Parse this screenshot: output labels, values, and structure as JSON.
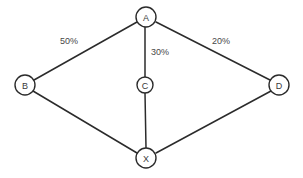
{
  "diagram": {
    "background_color": "#ffffff",
    "line_color": "#2b2b2b",
    "text_color": "#474747",
    "nodes": [
      {
        "id": "A",
        "label": "A",
        "cx": 146,
        "cy": 17,
        "r": 10
      },
      {
        "id": "B",
        "label": "B",
        "cx": 25,
        "cy": 85,
        "r": 10
      },
      {
        "id": "C",
        "label": "C",
        "cx": 145,
        "cy": 85,
        "r": 8
      },
      {
        "id": "D",
        "label": "D",
        "cx": 279,
        "cy": 85,
        "r": 10
      },
      {
        "id": "X",
        "label": "X",
        "cx": 146,
        "cy": 158,
        "r": 10
      }
    ],
    "edges": [
      {
        "id": "a-b",
        "from": "A",
        "to": "B",
        "x1": 137,
        "y1": 22,
        "x2": 34,
        "y2": 80
      },
      {
        "id": "a-c",
        "from": "A",
        "to": "C",
        "x1": 145,
        "y1": 27,
        "x2": 145,
        "y2": 77
      },
      {
        "id": "a-d",
        "from": "A",
        "to": "D",
        "x1": 156,
        "y1": 22,
        "x2": 270,
        "y2": 80
      },
      {
        "id": "b-x",
        "from": "B",
        "to": "X",
        "x1": 33,
        "y1": 91,
        "x2": 137,
        "y2": 153
      },
      {
        "id": "c-x",
        "from": "C",
        "to": "X",
        "x1": 145,
        "y1": 93,
        "x2": 146,
        "y2": 148
      },
      {
        "id": "d-x",
        "from": "D",
        "to": "X",
        "x1": 271,
        "y1": 91,
        "x2": 156,
        "y2": 153
      }
    ],
    "edge_labels": [
      {
        "id": "label-50",
        "edge": "a-b",
        "text": "50%",
        "left": 59,
        "top": 36
      },
      {
        "id": "label-30",
        "edge": "a-c",
        "text": "30%",
        "left": 150,
        "top": 47
      },
      {
        "id": "label-20",
        "edge": "a-d",
        "text": "20%",
        "left": 211,
        "top": 36
      }
    ]
  }
}
